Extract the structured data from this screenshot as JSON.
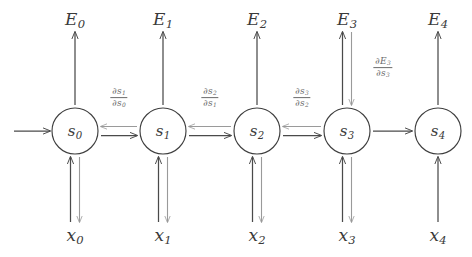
{
  "diagram": {
    "type": "recurrent-neural-network-unrolled-graph",
    "colors": {
      "background": "#ffffff",
      "forward_stroke": "#4a4a4a",
      "backward_stroke": "#9a9a9a",
      "node_stroke": "#3f3f3f",
      "node_fill": "#ffffff",
      "label_text": "#3a3a3a",
      "gradient_label_text": "#6b6b6b"
    },
    "geometry": {
      "width": 472,
      "height": 257,
      "node_radius": 23,
      "node_row_y": 131,
      "output_row_y": 20,
      "input_row_y": 236,
      "column_x": [
        75,
        163,
        257,
        347,
        438
      ]
    }
  },
  "states": [
    {
      "id": "s0",
      "letter": "s",
      "index": "0",
      "cx": 75,
      "cy": 131
    },
    {
      "id": "s1",
      "letter": "s",
      "index": "1",
      "cx": 163,
      "cy": 131
    },
    {
      "id": "s2",
      "letter": "s",
      "index": "2",
      "cx": 257,
      "cy": 131
    },
    {
      "id": "s3",
      "letter": "s",
      "index": "3",
      "cx": 347,
      "cy": 131
    },
    {
      "id": "s4",
      "letter": "s",
      "index": "4",
      "cx": 438,
      "cy": 131
    }
  ],
  "outputs": [
    {
      "id": "E0",
      "letter": "E",
      "index": "0",
      "cx": 75,
      "cy": 20,
      "has_backward_arrow": false
    },
    {
      "id": "E1",
      "letter": "E",
      "index": "1",
      "cx": 163,
      "cy": 20,
      "has_backward_arrow": false
    },
    {
      "id": "E2",
      "letter": "E",
      "index": "2",
      "cx": 257,
      "cy": 20,
      "has_backward_arrow": false
    },
    {
      "id": "E3",
      "letter": "E",
      "index": "3",
      "cx": 347,
      "cy": 20,
      "has_backward_arrow": true
    },
    {
      "id": "E4",
      "letter": "E",
      "index": "4",
      "cx": 438,
      "cy": 20,
      "has_backward_arrow": false
    }
  ],
  "inputs": [
    {
      "id": "x0",
      "letter": "x",
      "index": "0",
      "cx": 75,
      "cy": 236,
      "has_backward_arrow": true
    },
    {
      "id": "x1",
      "letter": "x",
      "index": "1",
      "cx": 163,
      "cy": 236,
      "has_backward_arrow": true
    },
    {
      "id": "x2",
      "letter": "x",
      "index": "2",
      "cx": 257,
      "cy": 236,
      "has_backward_arrow": true
    },
    {
      "id": "x3",
      "letter": "x",
      "index": "3",
      "cx": 347,
      "cy": 236,
      "has_backward_arrow": true
    },
    {
      "id": "x4",
      "letter": "x",
      "index": "4",
      "cx": 438,
      "cy": 236,
      "has_backward_arrow": false
    }
  ],
  "gradient_labels": [
    {
      "id": "ds1_ds0",
      "numerator_symbol": "∂s",
      "numerator_index": "1",
      "denominator_symbol": "∂s",
      "denominator_index": "0",
      "cx": 119,
      "cy": 98
    },
    {
      "id": "ds2_ds1",
      "numerator_symbol": "∂s",
      "numerator_index": "2",
      "denominator_symbol": "∂s",
      "denominator_index": "1",
      "cx": 210,
      "cy": 98
    },
    {
      "id": "ds3_ds2",
      "numerator_symbol": "∂s",
      "numerator_index": "3",
      "denominator_symbol": "∂s",
      "denominator_index": "2",
      "cx": 302,
      "cy": 98
    },
    {
      "id": "dE3_ds3",
      "numerator_symbol": "∂E",
      "numerator_index": "3",
      "denominator_symbol": "∂s",
      "denominator_index": "3",
      "cx": 383,
      "cy": 68
    }
  ],
  "recurrent_edges": [
    {
      "id": "s0-s1",
      "from": "s0",
      "to": "s1",
      "forward": true,
      "backward": true
    },
    {
      "id": "s1-s2",
      "from": "s1",
      "to": "s2",
      "forward": true,
      "backward": true
    },
    {
      "id": "s2-s3",
      "from": "s2",
      "to": "s3",
      "forward": true,
      "backward": true
    },
    {
      "id": "s3-s4",
      "from": "s3",
      "to": "s4",
      "forward": true,
      "backward": false
    }
  ],
  "entry_arrow": {
    "id": "initial-state-arrow",
    "x1": 14,
    "x2": 50,
    "y": 131
  }
}
